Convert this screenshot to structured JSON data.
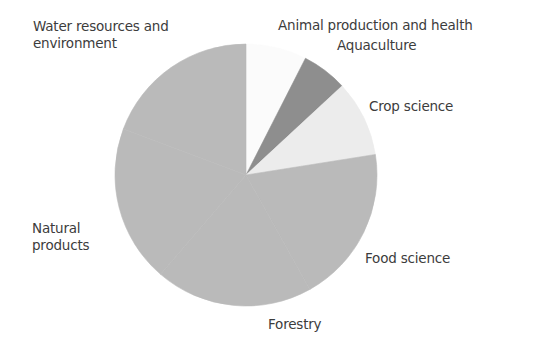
{
  "chart_data": {
    "type": "pie",
    "title": "",
    "start_angle_deg": 0,
    "direction": "clockwise",
    "center": [
      246,
      175
    ],
    "radius": 131,
    "slices": [
      {
        "label": "Animal production and health",
        "value": 7.5,
        "color": "#fbfbfb"
      },
      {
        "label": "Aquaculture",
        "value": 5.6,
        "color": "#8e8e8e"
      },
      {
        "label": "Crop science",
        "value": 9.4,
        "color": "#ececec"
      },
      {
        "label": "Food science",
        "value": 19.4,
        "color": "#bababa"
      },
      {
        "label": "Forestry",
        "value": 19.4,
        "color": "#bababa"
      },
      {
        "label": "Natural products",
        "value": 19.4,
        "color": "#bababa"
      },
      {
        "label": "Water resources and environment",
        "value": 19.3,
        "color": "#bababa"
      }
    ],
    "legend": "none (direct labels)",
    "labels": [
      {
        "lines": [
          "Water resources and",
          "environment"
        ],
        "x": 33,
        "y": 18
      },
      {
        "lines": [
          "Animal production and health"
        ],
        "x": 278,
        "y": 17
      },
      {
        "lines": [
          "Aquaculture"
        ],
        "x": 337,
        "y": 37
      },
      {
        "lines": [
          "Crop science"
        ],
        "x": 369,
        "y": 98
      },
      {
        "lines": [
          "Food science"
        ],
        "x": 365,
        "y": 250
      },
      {
        "lines": [
          "Forestry"
        ],
        "x": 268,
        "y": 316
      },
      {
        "lines": [
          "Natural",
          "products"
        ],
        "x": 32,
        "y": 220
      }
    ]
  }
}
